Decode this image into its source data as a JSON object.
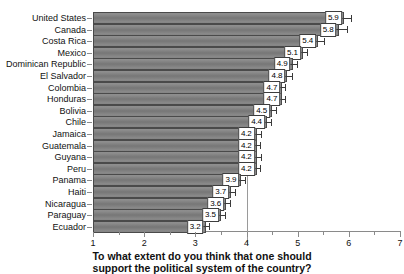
{
  "chart_data": {
    "type": "bar",
    "orientation": "horizontal",
    "title": "",
    "subtitle": "",
    "xlabel_line1": "To what extent do you think that one should",
    "xlabel_line2": "support the political system of the country?",
    "ylabel": "",
    "xlim": [
      1,
      7
    ],
    "xticks": [
      1,
      2,
      3,
      4,
      5,
      6,
      7
    ],
    "xtick_labels": [
      "1",
      "2",
      "3",
      "4",
      "5",
      "6",
      "7"
    ],
    "minor_xticks": [
      1.5,
      2.5,
      3.5,
      4.5,
      5.5,
      6.5
    ],
    "grid": false,
    "legend": "none",
    "reference_line": 4,
    "categories": [
      "United States",
      "Canada",
      "Costa Rica",
      "Mexico",
      "Dominican Republic",
      "El Salvador",
      "Colombia",
      "Honduras",
      "Bolivia",
      "Chile",
      "Jamaica",
      "Guatemala",
      "Guyana",
      "Peru",
      "Panama",
      "Haiti",
      "Nicaragua",
      "Paraguay",
      "Ecuador"
    ],
    "values": [
      5.9,
      5.8,
      5.4,
      5.1,
      4.9,
      4.8,
      4.7,
      4.7,
      4.5,
      4.4,
      4.2,
      4.2,
      4.2,
      4.2,
      3.9,
      3.7,
      3.6,
      3.5,
      3.2
    ],
    "value_labels": [
      "5.9",
      "5.8",
      "5.4",
      "5.1",
      "4.9",
      "4.8",
      "4.7",
      "4.7",
      "4.5",
      "4.4",
      "4.2",
      "4.2",
      "4.2",
      "4.2",
      "3.9",
      "3.7",
      "3.6",
      "3.5",
      "3.2"
    ],
    "error_low": [
      5.74,
      5.62,
      5.26,
      5.0,
      4.8,
      4.7,
      4.62,
      4.62,
      4.4,
      4.3,
      4.1,
      4.11,
      4.1,
      4.11,
      3.8,
      3.6,
      3.5,
      3.4,
      3.11
    ],
    "error_high": [
      6.06,
      5.98,
      5.54,
      5.2,
      5.0,
      4.9,
      4.78,
      4.78,
      4.6,
      4.5,
      4.3,
      4.29,
      4.3,
      4.29,
      4.0,
      3.8,
      3.7,
      3.6,
      3.29
    ]
  },
  "colors": {
    "bar_fill": "#7d7d7d",
    "bar_border": "#4a4a4a",
    "error_bar": "#3b3b3b",
    "axis": "#8a8a8a",
    "reference_line": "#9a9a9a",
    "label_box_bg": "#ffffff",
    "label_box_border": "#3d3d3d",
    "text": "#111111",
    "background": "#ffffff"
  }
}
